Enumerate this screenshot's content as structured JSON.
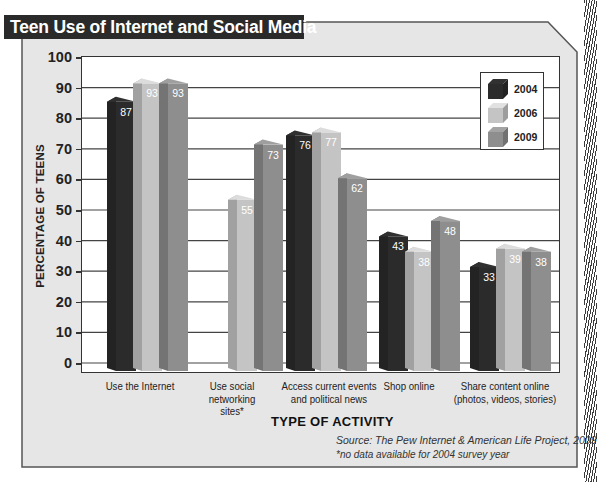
{
  "chart_data": {
    "type": "bar",
    "title": "Teen Use of Internet and Social Media",
    "xlabel": "TYPE OF ACTIVITY",
    "ylabel": "PERCENTAGE OF TEENS",
    "ylim": [
      0,
      100
    ],
    "yticks": [
      0,
      10,
      20,
      30,
      40,
      50,
      60,
      70,
      80,
      90,
      100
    ],
    "grid": true,
    "legend_position": "upper right",
    "categories": [
      "Use the Internet",
      "Use social networking sites*",
      "Access current events and political news",
      "Shop online",
      "Share content online (photos, videos, stories)"
    ],
    "series": [
      {
        "name": "2004",
        "color": "#2b2b2b",
        "values": [
          87,
          null,
          76,
          43,
          33
        ]
      },
      {
        "name": "2006",
        "color": "#c4c4c4",
        "values": [
          93,
          55,
          77,
          38,
          39
        ]
      },
      {
        "name": "2009",
        "color": "#8e8e8e",
        "values": [
          93,
          73,
          62,
          48,
          38
        ]
      }
    ],
    "annotations": [
      "Source: The Pew Internet & American Life Project, 2009",
      "*no data available for 2004 survey year"
    ]
  },
  "title": "Teen Use of Internet and Social Media",
  "yaxis": {
    "label": "PERCENTAGE OF TEENS",
    "ticks": [
      "100",
      "90",
      "80",
      "70",
      "60",
      "50",
      "40",
      "30",
      "20",
      "10",
      "0"
    ]
  },
  "xaxis": {
    "label": "TYPE OF ACTIVITY",
    "categories": [
      [
        "Use the Internet"
      ],
      [
        "Use social",
        "networking",
        "sites*"
      ],
      [
        "Access current events",
        "and political news"
      ],
      [
        "Shop online"
      ],
      [
        "Share content online",
        "(photos, videos, stories)"
      ]
    ]
  },
  "legend": {
    "items": [
      {
        "label": "2004",
        "color": "#2b2b2b"
      },
      {
        "label": "2006",
        "color": "#c4c4c4"
      },
      {
        "label": "2009",
        "color": "#8e8e8e"
      }
    ]
  },
  "source": "Source: The Pew Internet & American Life Project, 2009",
  "footnote": "*no data available for 2004 survey year"
}
